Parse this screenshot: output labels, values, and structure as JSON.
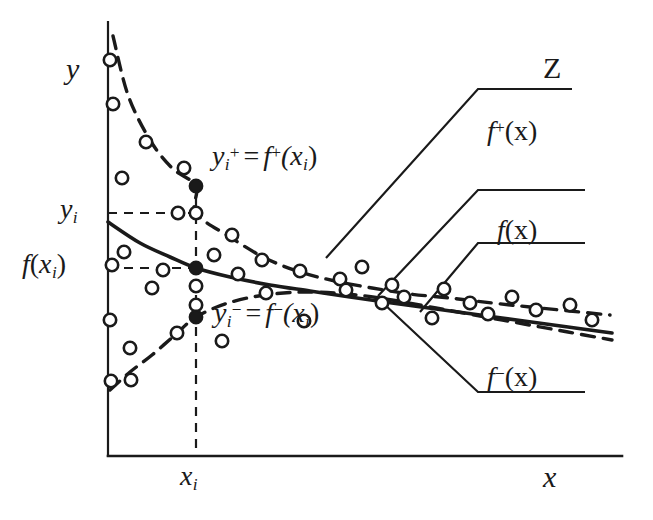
{
  "figure": {
    "title": "",
    "axes": {
      "y_axis_label": "y",
      "x_axis_label": "x",
      "x_origin_px": 108,
      "x_end_px": 622,
      "y_top_px": 22,
      "y_bottom_px": 456
    },
    "annotations": {
      "y_tick_label": "y",
      "y_tick_sub": "i",
      "f_tick_label": "f",
      "f_tick_paren_open": "(",
      "f_tick_var": "x",
      "f_tick_sub": "i",
      "f_tick_paren_close": ")",
      "x_tick_label": "x",
      "x_tick_sub": "i",
      "upper_point_label_lhs": "y",
      "upper_point_label_lhs_sub": "i",
      "upper_point_label_lhs_sup": "+",
      "upper_point_label_eq": "=",
      "upper_point_label_rhs": "f",
      "upper_point_label_rhs_sup": "+",
      "upper_point_label_rhs_args": "(x",
      "upper_point_label_rhs_sub": "i",
      "upper_point_label_rhs_close": ")",
      "lower_point_label_lhs": "y",
      "lower_point_label_lhs_sub": "i",
      "lower_point_label_lhs_sup": "−",
      "lower_point_label_eq": "=",
      "lower_point_label_rhs": "f",
      "lower_point_label_rhs_sup": "−",
      "lower_point_label_rhs_args": "(x",
      "lower_point_label_rhs_sub": "i",
      "lower_point_label_rhs_close": ")"
    },
    "callouts": [
      {
        "name": "Z",
        "label": "Z",
        "sup": "",
        "args": ""
      },
      {
        "name": "f_plus",
        "label": "f",
        "sup": "+",
        "args": "(x)"
      },
      {
        "name": "f",
        "label": "f",
        "sup": "",
        "args": "(x)"
      },
      {
        "name": "f_minus",
        "label": "f",
        "sup": "−",
        "args": "(x)"
      }
    ],
    "colors": {
      "ink": "#1a1a1a",
      "background": "#ffffff"
    }
  },
  "chart_data": {
    "type": "scatter",
    "title": "",
    "xlabel": "x",
    "ylabel": "y",
    "grid": false,
    "legend": false,
    "xlim": [
      108,
      622
    ],
    "ylim": [
      456,
      22
    ],
    "note": "Coordinates are given directly in screenshot pixel space (y grows downward). Three fitted curves are drawn: an upper dashed envelope f+(x), a central solid regression f(x), and a lower dashed envelope f-(x). Open circles are the scattered observations; three filled circles mark the values at x = x_i.",
    "reference_lines": {
      "x_i_vertical": {
        "x": 196,
        "y_top": 183,
        "y_bottom": 455,
        "style": "dashed"
      },
      "y_i_horizontal": {
        "y": 213,
        "x_start": 108,
        "x_end": 200,
        "style": "dashed"
      },
      "f_xi_horizontal": {
        "y": 268,
        "x_start": 108,
        "x_end": 200,
        "style": "dashed"
      }
    },
    "series": [
      {
        "name": "f+(x)",
        "style": "dashed",
        "points": [
          [
            113,
            36
          ],
          [
            128,
            95
          ],
          [
            150,
            140
          ],
          [
            172,
            168
          ],
          [
            196,
            186
          ],
          [
            196,
            213
          ],
          [
            230,
            237
          ],
          [
            265,
            258
          ],
          [
            300,
            272
          ],
          [
            335,
            281
          ],
          [
            372,
            288
          ],
          [
            410,
            294
          ],
          [
            450,
            298
          ],
          [
            492,
            303
          ],
          [
            530,
            307
          ],
          [
            570,
            311
          ],
          [
            610,
            315
          ]
        ]
      },
      {
        "name": "f(x)",
        "style": "solid",
        "points": [
          [
            108,
            222
          ],
          [
            140,
            243
          ],
          [
            170,
            257
          ],
          [
            196,
            268
          ],
          [
            230,
            277
          ],
          [
            270,
            285
          ],
          [
            310,
            291
          ],
          [
            350,
            297
          ],
          [
            392,
            303
          ],
          [
            436,
            309
          ],
          [
            480,
            315
          ],
          [
            524,
            321
          ],
          [
            568,
            327
          ],
          [
            612,
            333
          ]
        ]
      },
      {
        "name": "f-(x)",
        "style": "dashed",
        "points": [
          [
            110,
            390
          ],
          [
            130,
            372
          ],
          [
            152,
            355
          ],
          [
            175,
            335
          ],
          [
            196,
            317
          ],
          [
            228,
            303
          ],
          [
            265,
            295
          ],
          [
            305,
            292
          ],
          [
            348,
            294
          ],
          [
            392,
            300
          ],
          [
            436,
            308
          ],
          [
            480,
            316
          ],
          [
            524,
            324
          ],
          [
            568,
            332
          ],
          [
            612,
            340
          ]
        ]
      }
    ],
    "scatter_open_circles": [
      [
        110,
        60
      ],
      [
        113,
        104
      ],
      [
        122,
        178
      ],
      [
        124,
        252
      ],
      [
        112,
        265
      ],
      [
        110,
        320
      ],
      [
        111,
        381
      ],
      [
        130,
        348
      ],
      [
        131,
        380
      ],
      [
        146,
        142
      ],
      [
        152,
        288
      ],
      [
        163,
        270
      ],
      [
        178,
        213
      ],
      [
        177,
        333
      ],
      [
        184,
        168
      ],
      [
        196,
        213
      ],
      [
        196,
        286
      ],
      [
        196,
        305
      ],
      [
        214,
        255
      ],
      [
        222,
        341
      ],
      [
        232,
        235
      ],
      [
        238,
        274
      ],
      [
        262,
        260
      ],
      [
        266,
        293
      ],
      [
        300,
        271
      ],
      [
        304,
        321
      ],
      [
        340,
        279
      ],
      [
        346,
        290
      ],
      [
        362,
        267
      ],
      [
        382,
        303
      ],
      [
        392,
        285
      ],
      [
        404,
        297
      ],
      [
        432,
        318
      ],
      [
        444,
        289
      ],
      [
        470,
        303
      ],
      [
        488,
        314
      ],
      [
        512,
        297
      ],
      [
        536,
        310
      ],
      [
        570,
        305
      ],
      [
        592,
        320
      ]
    ],
    "scatter_filled_circles": [
      {
        "label": "y_i^+ = f^+(x_i)",
        "x": 196,
        "y": 186
      },
      {
        "label": "f(x_i)",
        "x": 196,
        "y": 268
      },
      {
        "label": "y_i^- = f^-(x_i)",
        "x": 196,
        "y": 317
      }
    ],
    "leader_lines": [
      {
        "for": "Z",
        "path": [
          [
            326,
            258
          ],
          [
            478,
            89
          ],
          [
            572,
            89
          ]
        ]
      },
      {
        "for": "f+(x)",
        "path": [
          [
            378,
            296
          ],
          [
            478,
            190
          ],
          [
            585,
            190
          ]
        ]
      },
      {
        "for": "f(x)",
        "path": [
          [
            420,
            312
          ],
          [
            478,
            243
          ],
          [
            585,
            243
          ]
        ]
      },
      {
        "for": "f-(x)",
        "path": [
          [
            383,
            303
          ],
          [
            478,
            392
          ],
          [
            585,
            392
          ]
        ]
      }
    ]
  }
}
